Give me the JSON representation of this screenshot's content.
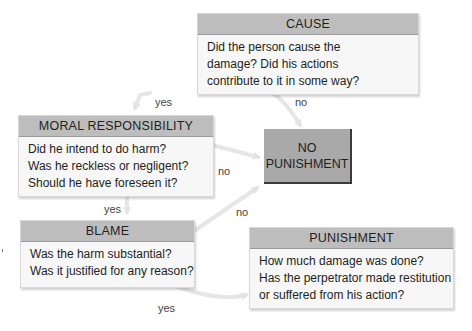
{
  "diagram": {
    "nodes": {
      "cause": {
        "title": "CAUSE",
        "lines": [
          "Did the person cause the",
          "damage? Did his actions",
          "contribute to it in some way?"
        ]
      },
      "moral_responsibility": {
        "title": "MORAL RESPONSIBILITY",
        "lines": [
          "Did he intend to do harm?",
          "Was he reckless or negligent?",
          "Should he have foreseen it?"
        ]
      },
      "no_punishment": {
        "lines": [
          "NO",
          "PUNISHMENT"
        ]
      },
      "blame": {
        "title": "BLAME",
        "lines": [
          "Was the harm substantial?",
          "Was it justified for any reason?"
        ]
      },
      "punishment": {
        "title": "PUNISHMENT",
        "lines": [
          "How much damage was done?",
          "Has the perpetrator made restitution",
          "or suffered from his action?"
        ]
      }
    },
    "edges": [
      {
        "from": "cause",
        "to": "moral_responsibility",
        "label": "yes"
      },
      {
        "from": "cause",
        "to": "no_punishment",
        "label": "no"
      },
      {
        "from": "moral_responsibility",
        "to": "no_punishment",
        "label": "no"
      },
      {
        "from": "moral_responsibility",
        "to": "blame",
        "label": "yes"
      },
      {
        "from": "blame",
        "to": "no_punishment",
        "label": "no"
      },
      {
        "from": "blame",
        "to": "punishment",
        "label": "yes"
      }
    ],
    "colors": {
      "header_fill": "#bdbdbd",
      "box_fill": "#f7f7f7",
      "terminal_fill": "#a9a9a9",
      "arrow": "#e6e6e6"
    }
  }
}
